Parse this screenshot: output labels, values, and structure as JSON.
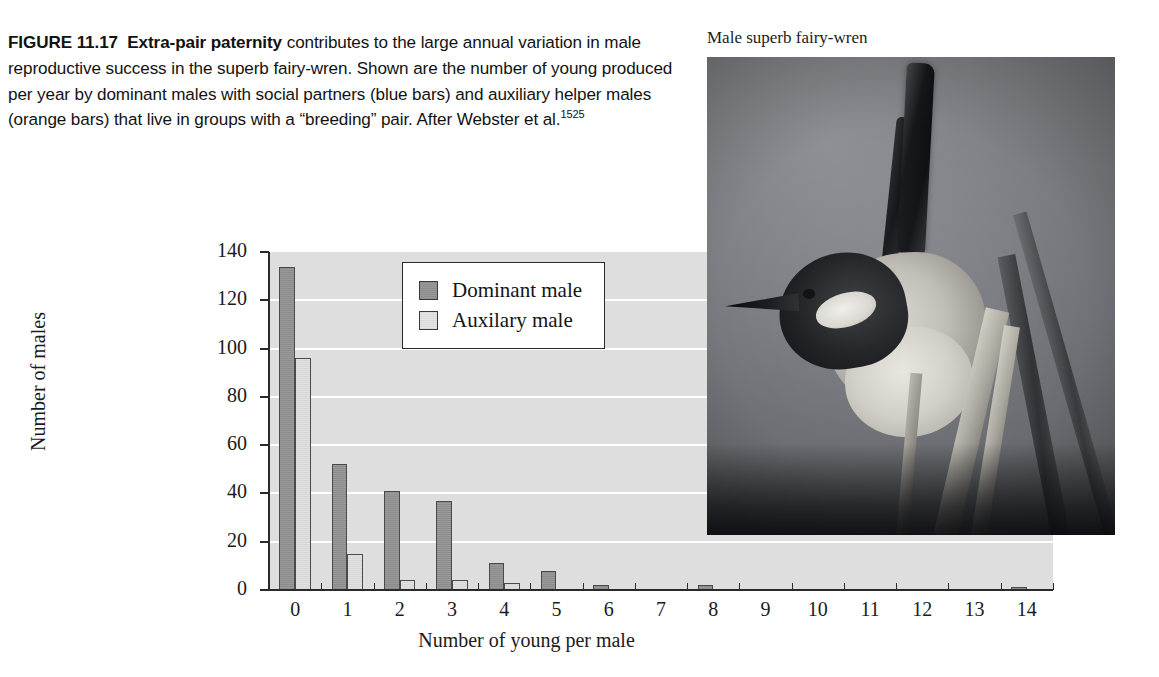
{
  "figure": {
    "number": "FIGURE 11.17",
    "lead": "Extra-pair paternity",
    "body": " contributes to the large annual variation in male reproductive success in the superb fairy-wren. Shown are the number of young produced per year by dominant males with social partners (blue bars) and auxiliary helper males (orange bars) that live in groups with a “breeding” pair. After Webster et al.",
    "reference_superscript": "1525"
  },
  "photo": {
    "caption": "Male superb fairy-wren",
    "alt_name": "superb-fairy-wren-photograph"
  },
  "chart_data": {
    "type": "bar",
    "title": "",
    "xlabel": "Number of young per male",
    "ylabel": "Number of males",
    "categories": [
      "0",
      "1",
      "2",
      "3",
      "4",
      "5",
      "6",
      "7",
      "8",
      "9",
      "10",
      "11",
      "12",
      "13",
      "14"
    ],
    "series": [
      {
        "name": "Dominant male",
        "color": "#8c8c8c",
        "values": [
          134,
          52,
          41,
          37,
          11,
          8,
          2,
          0,
          2,
          0,
          0,
          0,
          0,
          0,
          1
        ]
      },
      {
        "name": "Auxilary male",
        "color": "#dcdcdc",
        "values": [
          96,
          15,
          4,
          4,
          3,
          0,
          0,
          0,
          0,
          0,
          0,
          0,
          0,
          0,
          0
        ]
      }
    ],
    "ylim": [
      0,
      140
    ],
    "yticks": [
      "0",
      "20",
      "40",
      "60",
      "80",
      "100",
      "120",
      "140"
    ],
    "grid": true,
    "legend_position": "top-center",
    "plot_background": "#dedede",
    "gridline_color": "#ffffff"
  }
}
